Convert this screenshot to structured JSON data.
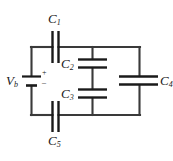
{
  "figure": {
    "name": "capacitor-network-circuit",
    "background_color": "#ffffff",
    "wire_color": "#3a3a3a",
    "plate_color": "#1a1a1a",
    "text_color": "#1a1a1a"
  },
  "source": {
    "label": "V",
    "subscript": "b",
    "plus_sign": "+",
    "minus_sign": "–"
  },
  "capacitors": [
    {
      "label": "C",
      "subscript": "1",
      "orientation": "vertical-plates"
    },
    {
      "label": "C",
      "subscript": "2",
      "orientation": "horizontal-plates"
    },
    {
      "label": "C",
      "subscript": "3",
      "orientation": "horizontal-plates"
    },
    {
      "label": "C",
      "subscript": "4",
      "orientation": "horizontal-plates"
    },
    {
      "label": "C",
      "subscript": "5",
      "orientation": "vertical-plates"
    }
  ]
}
